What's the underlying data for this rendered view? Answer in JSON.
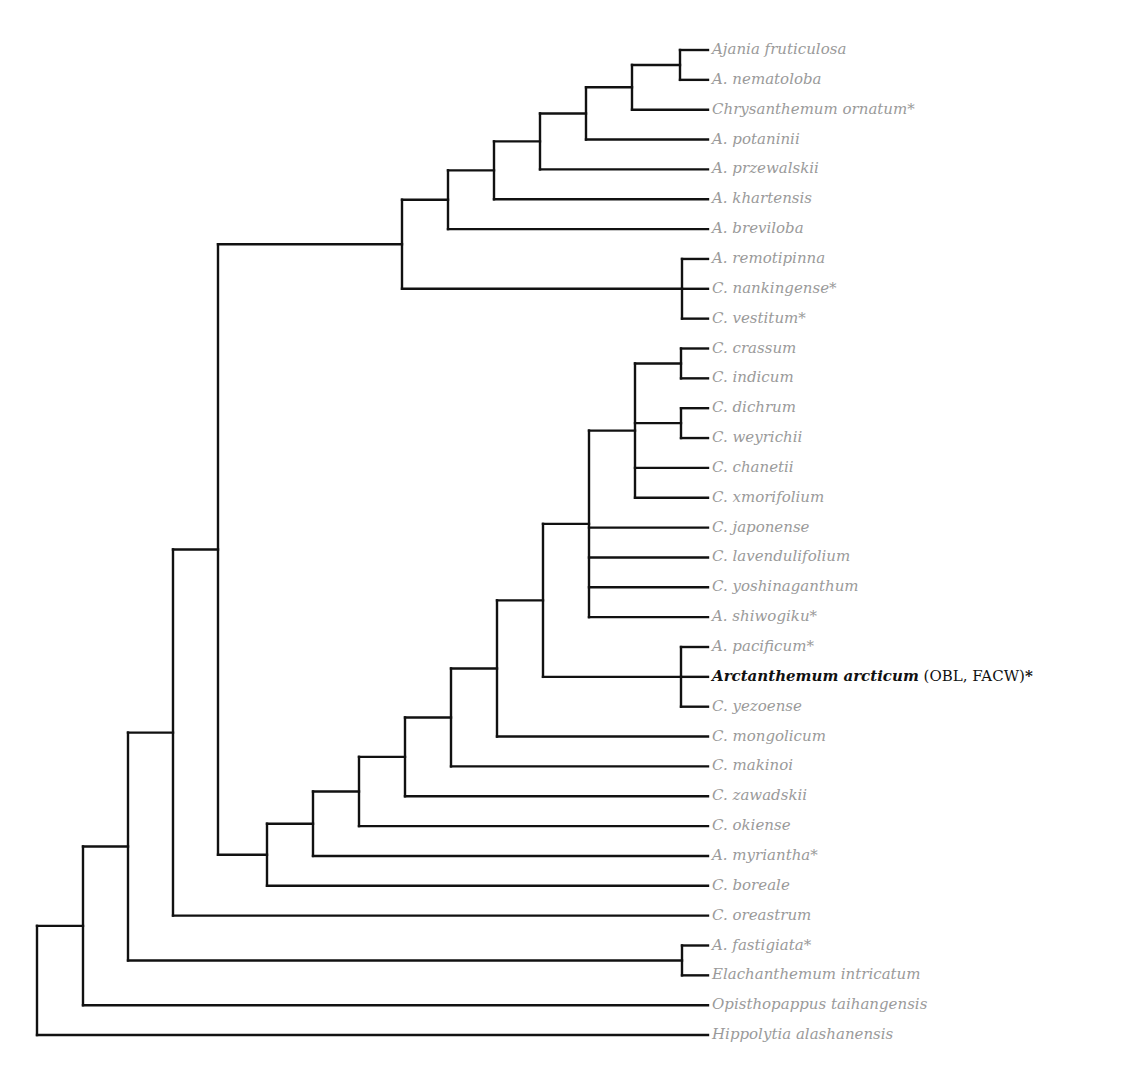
{
  "diagram": {
    "type": "phylogenetic-tree",
    "line_color": "#111111",
    "label_color": "#9a9a9a",
    "highlight_color": "#111111",
    "tip_x": 708,
    "first_leaf_y": 50,
    "leaf_spacing": 29.85,
    "leaves": [
      {
        "name": "Ajania fruticulosa",
        "star": false
      },
      {
        "name": "A. nematoloba",
        "star": false
      },
      {
        "name": "Chrysanthemum ornatum",
        "star": true
      },
      {
        "name": "A. potaninii",
        "star": false
      },
      {
        "name": "A. przewalskii",
        "star": false
      },
      {
        "name": "A. khartensis",
        "star": false
      },
      {
        "name": "A. breviloba",
        "star": false
      },
      {
        "name": "A. remotipinna",
        "star": false
      },
      {
        "name": "C. nankingense",
        "star": true
      },
      {
        "name": "C. vestitum",
        "star": true
      },
      {
        "name": "C. crassum",
        "star": false
      },
      {
        "name": "C. indicum",
        "star": false
      },
      {
        "name": "C. dichrum",
        "star": false
      },
      {
        "name": "C. weyrichii",
        "star": false
      },
      {
        "name": "C. chanetii",
        "star": false
      },
      {
        "name": "C. xmorifolium",
        "star": false
      },
      {
        "name": "C. japonense",
        "star": false
      },
      {
        "name": "C. lavendulifolium",
        "star": false
      },
      {
        "name": "C. yoshinaganthum",
        "star": false
      },
      {
        "name": "A. shiwogiku",
        "star": true
      },
      {
        "name": "A. pacificum",
        "star": true
      },
      {
        "name": "Arctanthemum arcticum",
        "star": true,
        "highlight": true,
        "suffix": " (OBL, FACW)"
      },
      {
        "name": "C. yezoense",
        "star": false
      },
      {
        "name": "C. mongolicum",
        "star": false
      },
      {
        "name": "C. makinoi",
        "star": false
      },
      {
        "name": "C. zawadskii",
        "star": false
      },
      {
        "name": "C. okiense",
        "star": false
      },
      {
        "name": "A. myriantha",
        "star": true
      },
      {
        "name": "C. boreale",
        "star": false
      },
      {
        "name": "C. oreastrum",
        "star": false
      },
      {
        "name": "A. fastigiata",
        "star": true
      },
      {
        "name": "Elachanthemum intricatum",
        "star": false
      },
      {
        "name": "Opisthopappus taihangensis",
        "star": false
      },
      {
        "name": "Hippolytia alashanensis",
        "star": false
      }
    ],
    "tree": {
      "x": 37,
      "children": [
        {
          "x": 83,
          "children": [
            {
              "x": 128,
              "children": [
                {
                  "x": 173,
                  "children": [
                    {
                      "x": 218,
                      "children": [
                        {
                          "x": 402,
                          "children": [
                            {
                              "x": 448,
                              "children": [
                                {
                                  "x": 494,
                                  "children": [
                                    {
                                      "x": 540,
                                      "children": [
                                        {
                                          "x": 586,
                                          "children": [
                                            {
                                              "x": 632,
                                              "children": [
                                                {
                                                  "x": 680,
                                                  "children": [
                                                    {
                                                      "leaf": 0
                                                    },
                                                    {
                                                      "leaf": 1
                                                    }
                                                  ]
                                                },
                                                {
                                                  "leaf": 2
                                                }
                                              ]
                                            },
                                            {
                                              "leaf": 3
                                            }
                                          ]
                                        },
                                        {
                                          "leaf": 4
                                        }
                                      ]
                                    },
                                    {
                                      "leaf": 5
                                    }
                                  ]
                                },
                                {
                                  "leaf": 6
                                }
                              ]
                            },
                            {
                              "x": 682,
                              "children": [
                                {
                                  "leaf": 7
                                },
                                {
                                  "leaf": 8
                                },
                                {
                                  "leaf": 9
                                }
                              ]
                            }
                          ]
                        },
                        {
                          "x": 267,
                          "children": [
                            {
                              "x": 313,
                              "children": [
                                {
                                  "x": 359,
                                  "children": [
                                    {
                                      "x": 405,
                                      "children": [
                                        {
                                          "x": 451,
                                          "children": [
                                            {
                                              "x": 497,
                                              "children": [
                                                {
                                                  "x": 543,
                                                  "children": [
                                                    {
                                                      "x": 589,
                                                      "children": [
                                                        {
                                                          "x": 635,
                                                          "children": [
                                                            {
                                                              "x": 681,
                                                              "children": [
                                                                {
                                                                  "leaf": 10
                                                                },
                                                                {
                                                                  "leaf": 11
                                                                }
                                                              ]
                                                            },
                                                            {
                                                              "x": 681,
                                                              "children": [
                                                                {
                                                                  "leaf": 12
                                                                },
                                                                {
                                                                  "leaf": 13
                                                                }
                                                              ]
                                                            },
                                                            {
                                                              "leaf": 14
                                                            },
                                                            {
                                                              "leaf": 15
                                                            }
                                                          ]
                                                        },
                                                        {
                                                          "leaf": 16
                                                        },
                                                        {
                                                          "leaf": 17
                                                        },
                                                        {
                                                          "leaf": 18
                                                        },
                                                        {
                                                          "leaf": 19
                                                        }
                                                      ]
                                                    },
                                                    {
                                                      "x": 681,
                                                      "children": [
                                                        {
                                                          "leaf": 20
                                                        },
                                                        {
                                                          "leaf": 21
                                                        },
                                                        {
                                                          "leaf": 22
                                                        }
                                                      ]
                                                    }
                                                  ]
                                                },
                                                {
                                                  "leaf": 23
                                                }
                                              ]
                                            },
                                            {
                                              "leaf": 24
                                            }
                                          ]
                                        },
                                        {
                                          "leaf": 25
                                        }
                                      ]
                                    },
                                    {
                                      "leaf": 26
                                    }
                                  ]
                                },
                                {
                                  "leaf": 27
                                }
                              ]
                            },
                            {
                              "leaf": 28
                            }
                          ]
                        }
                      ]
                    },
                    {
                      "leaf": 29
                    }
                  ]
                },
                {
                  "x": 682,
                  "children": [
                    {
                      "leaf": 30
                    },
                    {
                      "leaf": 31
                    }
                  ]
                }
              ]
            },
            {
              "leaf": 32
            }
          ]
        },
        {
          "leaf": 33
        }
      ]
    }
  }
}
